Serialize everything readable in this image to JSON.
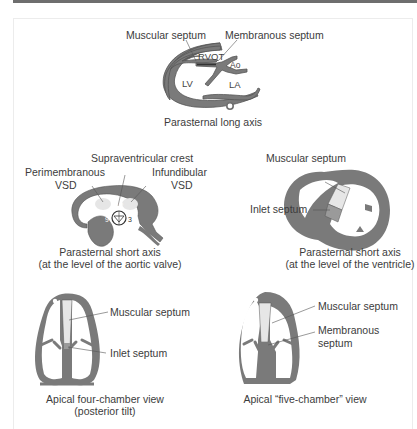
{
  "figure": {
    "panels": [
      {
        "id": "parasternal-long-axis",
        "caption": "Parasternal long axis",
        "labels": {
          "muscular_septum": "Muscular septum",
          "membranous_septum": "Membranous septum",
          "rvot": "RVOT",
          "ao": "Ao",
          "lv": "LV",
          "la": "LA"
        }
      },
      {
        "id": "parasternal-short-axis-aortic",
        "caption_line1": "Parasternal short axis",
        "caption_line2": "(at the level of the aortic valve)",
        "labels": {
          "supraventricular_crest": "Supraventricular crest",
          "perimembranous_line1": "Perimembranous",
          "perimembranous_line2": "VSD",
          "infundibular_line1": "Infundibular",
          "infundibular_line2": "VSD",
          "clock_12": "12",
          "clock_9": "9",
          "clock_3": "3"
        }
      },
      {
        "id": "parasternal-short-axis-ventricle",
        "caption_line1": "Parasternal short axis",
        "caption_line2": "(at the level of the ventricle)",
        "labels": {
          "muscular_septum": "Muscular septum",
          "inlet_septum": "Inlet septum"
        }
      },
      {
        "id": "apical-four-chamber",
        "caption_line1": "Apical four-chamber view",
        "caption_line2": "(posterior tilt)",
        "labels": {
          "muscular_septum": "Muscular septum",
          "inlet_septum": "Inlet septum"
        }
      },
      {
        "id": "apical-five-chamber",
        "caption_line1": "Apical “five-chamber” view",
        "labels": {
          "muscular_septum": "Muscular septum",
          "membranous_line1": "Membranous",
          "membranous_line2": "septum"
        }
      }
    ],
    "colors": {
      "wall": "#6f6f6f",
      "wall_fill": "#7a7a7a",
      "light_septum": "#e6e6e6",
      "dark_septum": "#8c8c8c",
      "leader_line": "#555555",
      "top_bar": "#6e6e6e"
    }
  }
}
